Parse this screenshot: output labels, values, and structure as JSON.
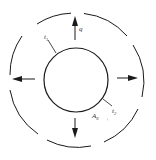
{
  "diagram": {
    "colors": {
      "stroke": "#1a1a1a",
      "background": "#ffffff",
      "text": "#333333"
    },
    "labels": {
      "flux": "q",
      "inner_temp": "t",
      "inner_temp_sub": "1",
      "outer_temp": "t",
      "outer_temp_sub": "2",
      "area": "A",
      "area_sub": "0",
      "plus": "+"
    },
    "arrows": [
      "up",
      "right",
      "down",
      "left"
    ]
  }
}
